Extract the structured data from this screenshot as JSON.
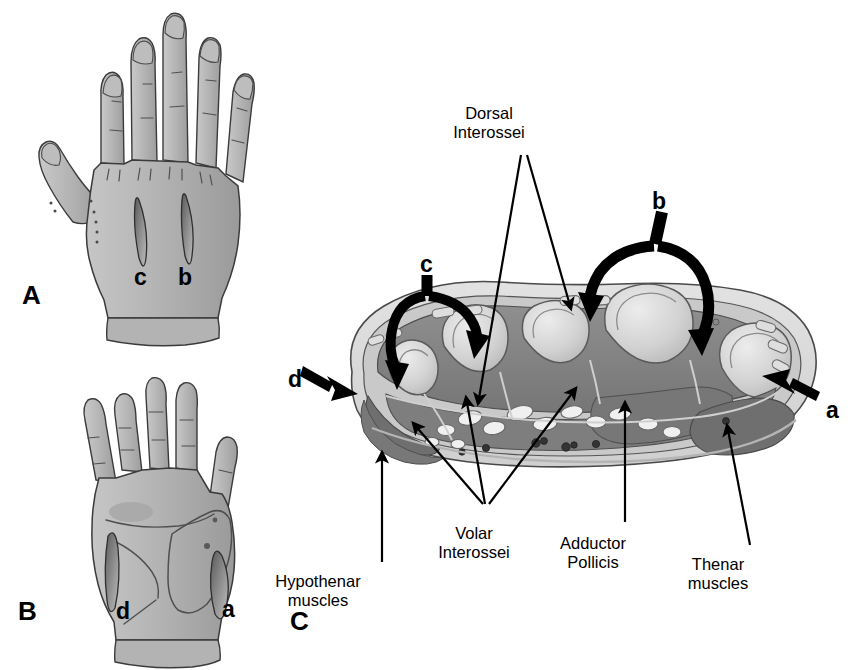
{
  "figure": {
    "type": "anatomical-illustration",
    "background_color": "#ffffff",
    "ink_color": "#000000",
    "skin_fill": "#b0b0b0",
    "skin_shadow": "#8e8e8e",
    "skin_highlight": "#c8c8c8",
    "subcutaneous_fill": "#d8d8d8",
    "fascia_fill": "#c4c4c4",
    "muscle_fill": "#8a8a8a",
    "muscle_dark": "#6f6f6f",
    "bone_fill": "#cfcfcf",
    "bone_light": "#e4e4e4",
    "tendon_fill": "#f2f2f2"
  },
  "panels": [
    {
      "id": "A",
      "letter": "A",
      "view": "dorsal hand",
      "letter_x": 22,
      "letter_y": 282,
      "markers": [
        {
          "label": "c",
          "x": 134,
          "y": 266,
          "meaning": "dorsal incision, 2nd intermetacarpal space"
        },
        {
          "label": "b",
          "x": 178,
          "y": 266,
          "meaning": "dorsal incision, 4th intermetacarpal space"
        }
      ]
    },
    {
      "id": "B",
      "letter": "B",
      "view": "volar hand",
      "letter_x": 18,
      "letter_y": 598,
      "markers": [
        {
          "label": "d",
          "x": 116,
          "y": 600,
          "meaning": "hypothenar incision"
        },
        {
          "label": "a",
          "x": 222,
          "y": 598,
          "meaning": "thenar incision"
        }
      ]
    },
    {
      "id": "C",
      "letter": "C",
      "view": "cross-section through the metacarpals",
      "letter_x": 290,
      "letter_y": 608,
      "markers": [
        {
          "label": "c",
          "x": 420,
          "y": 253,
          "meaning": "dorsal approach arrow, radial side"
        },
        {
          "label": "b",
          "x": 652,
          "y": 190,
          "meaning": "dorsal approach arrow, ulnar side"
        },
        {
          "label": "d",
          "x": 288,
          "y": 368,
          "meaning": "hypothenar approach arrow"
        },
        {
          "label": "a",
          "x": 826,
          "y": 399,
          "meaning": "thenar approach arrow"
        }
      ],
      "callouts": [
        {
          "name": "dorsal-interossei",
          "text": "Dorsal\nInterossei",
          "x": 489,
          "y": 104,
          "align": "center"
        },
        {
          "name": "volar-interossei",
          "text": "Volar\nInterossei",
          "x": 474,
          "y": 524,
          "align": "center"
        },
        {
          "name": "adductor-pollicis",
          "text": "Adductor\nPollicis",
          "x": 593,
          "y": 534,
          "align": "center"
        },
        {
          "name": "thenar-muscles",
          "text": "Thenar\nmuscles",
          "x": 718,
          "y": 555,
          "align": "center"
        },
        {
          "name": "hypothenar-muscles",
          "text": "Hypothenar\nmuscles",
          "x": 318,
          "y": 572,
          "align": "center"
        }
      ]
    }
  ],
  "legend_keys": [
    {
      "key": "a",
      "description": "Thenar incision"
    },
    {
      "key": "b",
      "description": "Dorsal ulnar incision"
    },
    {
      "key": "c",
      "description": "Dorsal radial incision"
    },
    {
      "key": "d",
      "description": "Hypothenar incision"
    }
  ]
}
